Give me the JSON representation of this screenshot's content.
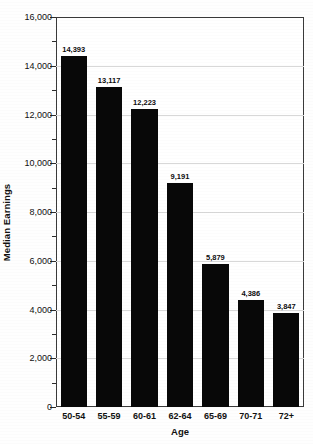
{
  "chart_data": {
    "type": "bar",
    "title": "",
    "subtitle": "",
    "xlabel": "Age",
    "ylabel": "Median Earnings",
    "categories": [
      "50-54",
      "55-59",
      "60-61",
      "62-64",
      "65-69",
      "70-71",
      "72+"
    ],
    "values": [
      14393,
      13117,
      12223,
      9191,
      5879,
      4386,
      3847
    ],
    "value_labels": [
      "14,393",
      "13,117",
      "12,223",
      "9,191",
      "5,879",
      "4,386",
      "3,847"
    ],
    "ylim": [
      0,
      16000
    ],
    "ytick_step": 2000,
    "yticks": [
      0,
      2000,
      4000,
      6000,
      8000,
      10000,
      12000,
      14000,
      16000
    ],
    "ytick_labels": [
      "0",
      "2,000",
      "4,000",
      "6,000",
      "8,000",
      "10,000",
      "12,000",
      "14,000",
      "16,000"
    ],
    "minor_ticks": true,
    "grid": true,
    "legend": false,
    "bar_color": "#080808",
    "grid_color": "#d8d8d8",
    "axis_color": "#3a3a3a",
    "background": "#ffffff"
  },
  "axes": {
    "y_title": "Median Earnings",
    "x_title": "Age"
  }
}
